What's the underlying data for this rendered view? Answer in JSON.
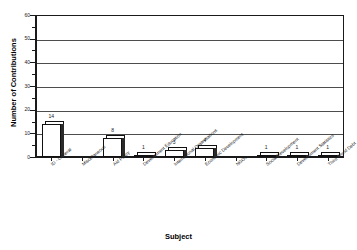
{
  "chart_data": {
    "type": "bar",
    "title": "",
    "xlabel": "Subject",
    "ylabel": "Number of Contributions",
    "ylim": [
      0,
      60
    ],
    "yticks": [
      0,
      10,
      20,
      30,
      40,
      50,
      60
    ],
    "grid": true,
    "legend": "none",
    "categories": [
      "ID - General",
      "Miscellaneous",
      "Aid Policy",
      "Development Education",
      "International Organisations",
      "Economic Development",
      "NGOs",
      "Social Development",
      "Development Statistics",
      "Third World Debt"
    ],
    "values": [
      14,
      0,
      8,
      1,
      3,
      4,
      0,
      1,
      1,
      1
    ],
    "value_labels": [
      "14",
      "",
      "8",
      "1",
      "3",
      "4",
      "",
      "1",
      "1",
      "1"
    ]
  },
  "axes": {
    "y_title": "Number of Contributions",
    "x_title": "Subject",
    "y_tick_labels": [
      "0",
      "10",
      "20",
      "30",
      "40",
      "50",
      "60"
    ]
  },
  "header": {
    "clipped_title": ""
  }
}
